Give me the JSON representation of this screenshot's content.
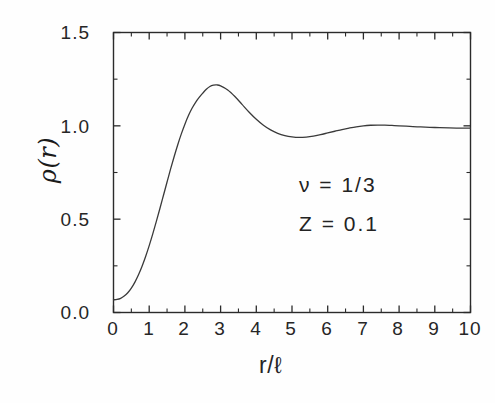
{
  "figure": {
    "background": "#fefefe",
    "line_color": "#3a3a3a",
    "axis_color": "#2b2b2b"
  },
  "axes": {
    "y_title": "ρ(r)",
    "x_title": "r/ℓ",
    "y_ticks": [
      "0.0",
      "0.5",
      "1.0",
      "1.5"
    ],
    "x_ticks": [
      "0",
      "1",
      "2",
      "3",
      "4",
      "5",
      "6",
      "7",
      "8",
      "9",
      "10"
    ]
  },
  "annotations": [
    {
      "name": "nu-annotation",
      "text": "ν  =  1/3"
    },
    {
      "name": "z-annotation",
      "text": "Z  =  0.1"
    }
  ],
  "chart_data": {
    "type": "line",
    "title": "",
    "subtitle": "",
    "xlabel": "r/ℓ",
    "ylabel": "ρ(r)",
    "xlim": [
      0,
      10
    ],
    "ylim": [
      0.0,
      1.5
    ],
    "grid": false,
    "legend": null,
    "x_major_ticks": [
      0,
      1,
      2,
      3,
      4,
      5,
      6,
      7,
      8,
      9,
      10
    ],
    "x_minor_ticks": [
      0.5,
      1.5,
      2.5,
      3.5,
      4.5,
      5.5,
      6.5,
      7.5,
      8.5,
      9.5
    ],
    "y_major_ticks": [
      0.0,
      0.5,
      1.0,
      1.5
    ],
    "y_minor_ticks": [
      0.25,
      0.75,
      1.25
    ],
    "tick_direction": "in",
    "annotations": [
      "ν  =  1/3",
      "Z  =  0.1"
    ],
    "series": [
      {
        "name": "density-profile",
        "color": "#3a3a3a",
        "x": [
          0.0,
          0.1,
          0.2,
          0.3,
          0.4,
          0.5,
          0.6,
          0.7,
          0.8,
          0.9,
          1.0,
          1.1,
          1.2,
          1.3,
          1.4,
          1.5,
          1.6,
          1.7,
          1.8,
          1.9,
          2.0,
          2.1,
          2.2,
          2.3,
          2.4,
          2.5,
          2.6,
          2.7,
          2.8,
          2.9,
          3.0,
          3.2,
          3.4,
          3.6,
          3.8,
          4.0,
          4.2,
          4.4,
          4.6,
          4.8,
          5.0,
          5.2,
          5.4,
          5.6,
          5.8,
          6.0,
          6.2,
          6.4,
          6.6,
          6.8,
          7.0,
          7.2,
          7.4,
          7.6,
          7.8,
          8.0,
          8.3,
          8.6,
          9.0,
          9.4,
          9.7,
          10.0
        ],
        "y": [
          0.068,
          0.07,
          0.076,
          0.088,
          0.106,
          0.131,
          0.163,
          0.202,
          0.248,
          0.3,
          0.358,
          0.421,
          0.488,
          0.557,
          0.628,
          0.699,
          0.769,
          0.836,
          0.899,
          0.957,
          1.009,
          1.055,
          1.094,
          1.126,
          1.152,
          1.175,
          1.196,
          1.211,
          1.218,
          1.219,
          1.214,
          1.192,
          1.157,
          1.115,
          1.073,
          1.035,
          1.003,
          0.978,
          0.96,
          0.948,
          0.941,
          0.938,
          0.94,
          0.945,
          0.953,
          0.962,
          0.971,
          0.98,
          0.988,
          0.995,
          1.0,
          1.003,
          1.004,
          1.004,
          1.002,
          1.0,
          0.997,
          0.994,
          0.991,
          0.989,
          0.988,
          0.988
        ]
      }
    ]
  }
}
